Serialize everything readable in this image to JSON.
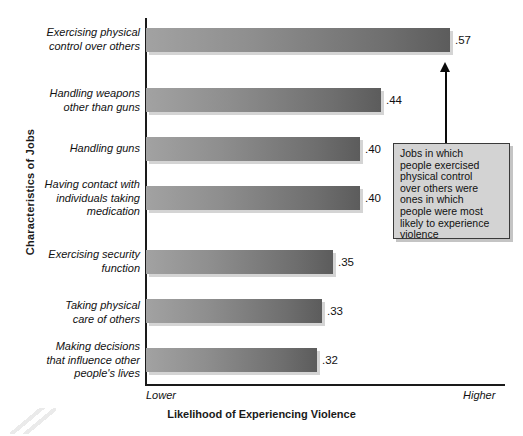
{
  "chart_data": {
    "type": "bar",
    "orientation": "horizontal",
    "title": "",
    "xlabel": "Likelihood of Experiencing Violence",
    "ylabel": "Characteristics of Jobs",
    "x_axis_low_label": "Lower",
    "x_axis_high_label": "Higher",
    "xlim": [
      0,
      0.6
    ],
    "grid": false,
    "legend": "none",
    "categories": [
      "Exercising physical control over others",
      "Handling weapons other than guns",
      "Handling guns",
      "Having contact with individuals taking medication",
      "Exercising security function",
      "Taking physical care of others",
      "Making decisions that influence other people's lives"
    ],
    "category_lines": [
      [
        "Exercising physical",
        "control over others"
      ],
      [
        "Handling weapons",
        "other than guns"
      ],
      [
        "Handling guns"
      ],
      [
        "Having contact with",
        "individuals taking",
        "medication"
      ],
      [
        "Exercising security",
        "function"
      ],
      [
        "Taking physical",
        "care of others"
      ],
      [
        "Making decisions",
        "that influence other",
        "people's lives"
      ]
    ],
    "values": [
      0.57,
      0.44,
      0.4,
      0.4,
      0.35,
      0.33,
      0.32
    ],
    "value_labels": [
      ".57",
      ".44",
      ".40",
      ".40",
      ".35",
      ".33",
      ".32"
    ],
    "bar_color_light": "#a2a2a2",
    "bar_color_dark": "#5c5c5c"
  },
  "annotation": {
    "text": "Jobs in which people exercised physical control over others were ones in which people were most likely to experience violence",
    "lines": [
      "Jobs in which",
      "people exercised",
      "physical control",
      "over others were",
      "ones in which",
      "people were most",
      "likely to experience",
      "violence"
    ],
    "points_to_category": "Exercising physical control over others",
    "box_color": "#d3d3d3",
    "border_color": "#3a3a3a"
  }
}
